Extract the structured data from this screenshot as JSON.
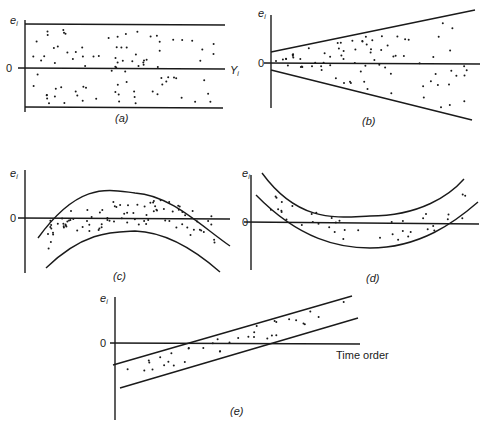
{
  "figure": {
    "panels": [
      {
        "id": "a",
        "caption": "(a)",
        "ylabel": "e_i",
        "zero_label": "0",
        "xlabel": "Y_i",
        "pattern": "horizontal band"
      },
      {
        "id": "b",
        "caption": "(b)",
        "ylabel": "e_i",
        "zero_label": "0",
        "xlabel": "",
        "pattern": "funnel widening"
      },
      {
        "id": "c",
        "caption": "(c)",
        "ylabel": "e_i",
        "zero_label": "0",
        "xlabel": "",
        "pattern": "inverted U curve"
      },
      {
        "id": "d",
        "caption": "(d)",
        "ylabel": "e_i",
        "zero_label": "0",
        "xlabel": "",
        "pattern": "U curve"
      },
      {
        "id": "e",
        "caption": "(e)",
        "ylabel": "e_i",
        "zero_label": "0",
        "xlabel": "Time order",
        "pattern": "linear trend"
      }
    ]
  },
  "labels": {
    "a": {
      "y": "e",
      "sub": "i",
      "zero": "0",
      "x": "Y",
      "xsub": "i",
      "cap": "(a)"
    },
    "b": {
      "y": "e",
      "sub": "i",
      "zero": "0",
      "cap": "(b)"
    },
    "c": {
      "y": "e",
      "sub": "i",
      "zero": "0",
      "cap": "(c)"
    },
    "d": {
      "y": "e",
      "sub": "i",
      "zero": "0",
      "cap": "(d)"
    },
    "e": {
      "y": "e",
      "sub": "i",
      "zero": "0",
      "x": "Time order",
      "cap": "(e)"
    }
  },
  "chart_data": [
    {
      "type": "scatter",
      "title": "(a)",
      "xlabel": "Y_i",
      "ylabel": "e_i",
      "band": "constant horizontal band around 0",
      "grid": false
    },
    {
      "type": "scatter",
      "title": "(b)",
      "xlabel": "",
      "ylabel": "e_i",
      "band": "funnel: spread increases with x",
      "grid": false
    },
    {
      "type": "scatter",
      "title": "(c)",
      "xlabel": "",
      "ylabel": "e_i",
      "band": "inverted parabola",
      "grid": false
    },
    {
      "type": "scatter",
      "title": "(d)",
      "xlabel": "",
      "ylabel": "e_i",
      "band": "parabola (U)",
      "grid": false
    },
    {
      "type": "scatter",
      "title": "(e)",
      "xlabel": "Time order",
      "ylabel": "e_i",
      "band": "increasing linear trend",
      "grid": false
    }
  ]
}
